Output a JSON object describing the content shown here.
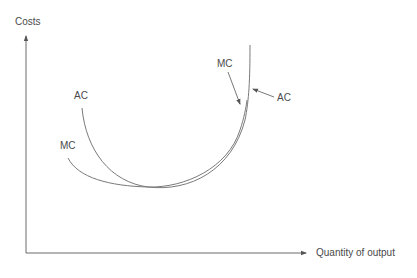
{
  "diagram": {
    "type": "cost-curves",
    "axes": {
      "y_label": "Costs",
      "x_label": "Quantity of output"
    },
    "curves": [
      {
        "name": "AC",
        "description": "Average cost curve, U-shaped"
      },
      {
        "name": "MC",
        "description": "Marginal cost curve, intersects AC at its minimum"
      }
    ],
    "labels": {
      "ac_left": "AC",
      "mc_left": "MC",
      "mc_right": "MC",
      "ac_right": "AC"
    },
    "colors": {
      "line": "#7a7a7a",
      "axis": "#6a6a6a",
      "text": "#4a4a4a"
    }
  }
}
